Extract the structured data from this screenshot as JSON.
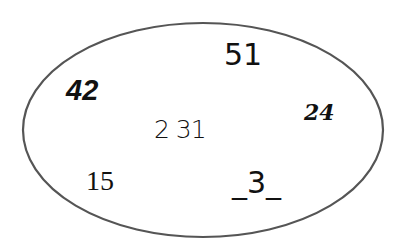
{
  "diagram": {
    "shape": "ellipse",
    "stroke_color": "#555555",
    "items": [
      {
        "text": "51"
      },
      {
        "text": "42"
      },
      {
        "text": "24"
      },
      {
        "text": "2 31"
      },
      {
        "text": "15"
      },
      {
        "text": "_3_"
      }
    ]
  }
}
